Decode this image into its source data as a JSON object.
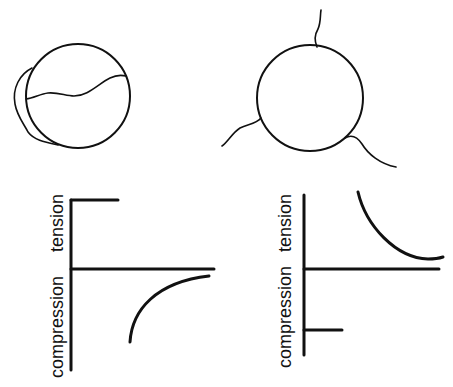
{
  "figure": {
    "panels": [
      {
        "id": "top-left",
        "description": "circle with wavy internal line and crescent attached on left side"
      },
      {
        "id": "top-right",
        "description": "circle with three wavy filaments radiating outward"
      },
      {
        "id": "bottom-left",
        "axis_labels": {
          "upper": "tension",
          "lower": "compression"
        },
        "description": "short tension bar near top; curve in compression region approaching axis"
      },
      {
        "id": "bottom-right",
        "axis_labels": {
          "upper": "tension",
          "lower": "compression"
        },
        "description": "short compression bar near bottom; curve in tension region decaying toward axis"
      }
    ]
  },
  "colors": {
    "ink": "#111111",
    "background": "#ffffff"
  }
}
